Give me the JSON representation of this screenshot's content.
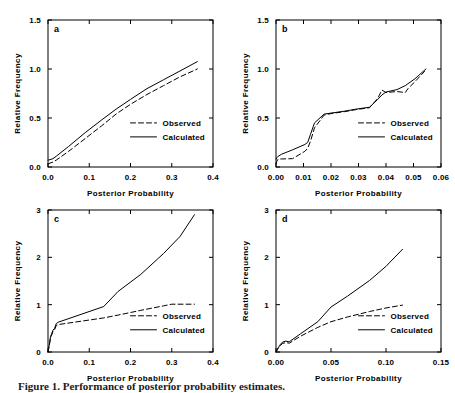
{
  "figure": {
    "caption": "Figure 1. Performance of posterior probability estimates.",
    "background_color": "#ffffff",
    "ink_color": "#000000"
  },
  "legend": {
    "observed_label": "Observed",
    "calculated_label": "Calculated"
  },
  "axis_titles": {
    "x": "Posterior Probability",
    "y": "Relative Frequency"
  },
  "panels": {
    "a": {
      "letter": "a",
      "xlabel": "Posterior Probability",
      "ylabel": "Relative Frequency",
      "xticks": [
        "0.0",
        "0.1",
        "0.2",
        "0.3",
        "0.4"
      ],
      "yticks": [
        "0.0",
        "0.5",
        "1.0",
        "1.5"
      ]
    },
    "b": {
      "letter": "b",
      "xlabel": "Posterior Probability",
      "ylabel": "Relative Frequency",
      "xticks": [
        "0.00",
        "0.01",
        "0.02",
        "0.03",
        "0.04",
        "0.05",
        "0.06"
      ],
      "yticks": [
        "0.0",
        "0.5",
        "1.0",
        "1.5"
      ]
    },
    "c": {
      "letter": "c",
      "xlabel": "Posterior Probability",
      "ylabel": "Relative Frequency",
      "xticks": [
        "0.0",
        "0.1",
        "0.2",
        "0.3",
        "0.4"
      ],
      "yticks": [
        "0",
        "1",
        "2",
        "3"
      ]
    },
    "d": {
      "letter": "d",
      "xlabel": "Posterior Probability",
      "ylabel": "Relative Frequency",
      "xticks": [
        "0.00",
        "0.05",
        "0.10",
        "0.15"
      ],
      "yticks": [
        "0",
        "1",
        "2",
        "3"
      ]
    }
  },
  "chart_data": [
    {
      "panel": "a",
      "type": "line",
      "title": "a",
      "xlabel": "Posterior Probability",
      "ylabel": "Relative Frequency",
      "xlim": [
        0.0,
        0.4
      ],
      "ylim": [
        0.0,
        1.5
      ],
      "xticks": [
        0.0,
        0.1,
        0.2,
        0.3,
        0.4
      ],
      "yticks": [
        0.0,
        0.5,
        1.0,
        1.5
      ],
      "grid": false,
      "legend_position": "center-right",
      "series": [
        {
          "name": "Observed",
          "style": "dashed",
          "x": [
            0.0,
            0.005,
            0.012,
            0.02,
            0.05,
            0.09,
            0.13,
            0.165,
            0.2,
            0.24,
            0.28,
            0.32,
            0.362
          ],
          "y": [
            0.03,
            0.04,
            0.05,
            0.07,
            0.16,
            0.29,
            0.42,
            0.54,
            0.64,
            0.74,
            0.83,
            0.92,
            1.0
          ]
        },
        {
          "name": "Calculated",
          "style": "solid",
          "x": [
            0.0,
            0.005,
            0.012,
            0.02,
            0.05,
            0.09,
            0.13,
            0.165,
            0.2,
            0.24,
            0.28,
            0.32,
            0.362
          ],
          "y": [
            0.07,
            0.075,
            0.085,
            0.11,
            0.21,
            0.35,
            0.48,
            0.59,
            0.69,
            0.8,
            0.89,
            0.98,
            1.075
          ]
        }
      ]
    },
    {
      "panel": "b",
      "type": "line",
      "title": "b",
      "xlabel": "Posterior Probability",
      "ylabel": "Relative Frequency",
      "xlim": [
        0.0,
        0.06
      ],
      "ylim": [
        0.0,
        1.5
      ],
      "xticks": [
        0.0,
        0.01,
        0.02,
        0.03,
        0.04,
        0.05,
        0.06
      ],
      "yticks": [
        0.0,
        0.5,
        1.0,
        1.5
      ],
      "grid": false,
      "legend_position": "center-right",
      "series": [
        {
          "name": "Observed",
          "style": "dashed",
          "x": [
            0.0,
            0.0003,
            0.0008,
            0.002,
            0.006,
            0.0105,
            0.0115,
            0.0125,
            0.014,
            0.0175,
            0.02,
            0.025,
            0.029,
            0.034,
            0.037,
            0.0385,
            0.04,
            0.044,
            0.047,
            0.048,
            0.0505,
            0.054
          ],
          "y": [
            0.03,
            0.06,
            0.08,
            0.082,
            0.085,
            0.16,
            0.19,
            0.26,
            0.4,
            0.53,
            0.545,
            0.565,
            0.585,
            0.605,
            0.7,
            0.785,
            0.76,
            0.77,
            0.76,
            0.8,
            0.87,
            0.975
          ]
        },
        {
          "name": "Calculated",
          "style": "solid",
          "x": [
            0.0,
            0.0003,
            0.0008,
            0.002,
            0.006,
            0.0105,
            0.0115,
            0.0125,
            0.014,
            0.0175,
            0.02,
            0.025,
            0.029,
            0.034,
            0.037,
            0.0385,
            0.04,
            0.044,
            0.047,
            0.048,
            0.0505,
            0.0545
          ],
          "y": [
            0.08,
            0.095,
            0.11,
            0.13,
            0.175,
            0.23,
            0.25,
            0.33,
            0.45,
            0.54,
            0.55,
            0.57,
            0.59,
            0.61,
            0.69,
            0.735,
            0.765,
            0.79,
            0.83,
            0.85,
            0.9,
            1.0
          ]
        }
      ]
    },
    {
      "panel": "c",
      "type": "line",
      "title": "c",
      "xlabel": "Posterior Probability",
      "ylabel": "Relative Frequency",
      "xlim": [
        0.0,
        0.4
      ],
      "ylim": [
        0.0,
        3.0
      ],
      "xticks": [
        0.0,
        0.1,
        0.2,
        0.3,
        0.4
      ],
      "yticks": [
        0,
        1,
        2,
        3
      ],
      "grid": false,
      "legend_position": "center-right",
      "series": [
        {
          "name": "Observed",
          "style": "dashed",
          "x": [
            0.0,
            0.002,
            0.004,
            0.006,
            0.009,
            0.012,
            0.016,
            0.02,
            0.025,
            0.135,
            0.17,
            0.225,
            0.28,
            0.3,
            0.355
          ],
          "y": [
            0.0,
            0.09,
            0.18,
            0.3,
            0.36,
            0.43,
            0.47,
            0.56,
            0.58,
            0.72,
            0.78,
            0.88,
            0.975,
            1.01,
            1.01
          ]
        },
        {
          "name": "Calculated",
          "style": "solid",
          "x": [
            0.0,
            0.002,
            0.004,
            0.006,
            0.009,
            0.012,
            0.016,
            0.02,
            0.025,
            0.135,
            0.17,
            0.225,
            0.28,
            0.32,
            0.355
          ],
          "y": [
            0.0,
            0.1,
            0.2,
            0.32,
            0.39,
            0.46,
            0.5,
            0.6,
            0.63,
            0.96,
            1.28,
            1.64,
            2.08,
            2.44,
            2.9
          ]
        }
      ]
    },
    {
      "panel": "d",
      "type": "line",
      "title": "d",
      "xlabel": "Posterior Probability",
      "ylabel": "Relative Frequency",
      "xlim": [
        0.0,
        0.15
      ],
      "ylim": [
        0.0,
        3.0
      ],
      "xticks": [
        0.0,
        0.05,
        0.1,
        0.15
      ],
      "yticks": [
        0,
        1,
        2,
        3
      ],
      "grid": false,
      "legend_position": "center-right",
      "series": [
        {
          "name": "Observed",
          "style": "dashed",
          "x": [
            0.0,
            0.002,
            0.004,
            0.006,
            0.009,
            0.012,
            0.022,
            0.038,
            0.05,
            0.065,
            0.085,
            0.1,
            0.115
          ],
          "y": [
            0.0,
            0.08,
            0.14,
            0.18,
            0.2,
            0.185,
            0.33,
            0.52,
            0.64,
            0.74,
            0.855,
            0.93,
            0.99
          ]
        },
        {
          "name": "Calculated",
          "style": "solid",
          "x": [
            0.0,
            0.002,
            0.004,
            0.006,
            0.009,
            0.012,
            0.022,
            0.038,
            0.05,
            0.065,
            0.085,
            0.1,
            0.115
          ],
          "y": [
            0.0,
            0.09,
            0.16,
            0.21,
            0.23,
            0.215,
            0.38,
            0.64,
            0.95,
            1.18,
            1.51,
            1.81,
            2.17
          ]
        }
      ]
    }
  ]
}
